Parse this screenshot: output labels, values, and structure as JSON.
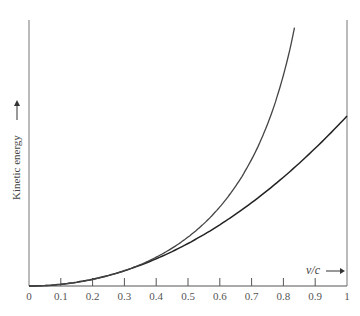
{
  "chart_data": {
    "type": "line",
    "title": "",
    "xlabel": "v/c",
    "ylabel": "Kinetic energy",
    "xlim": [
      0,
      1
    ],
    "x_ticks": [
      "0",
      "0.1",
      "0.2",
      "0.3",
      "0.4",
      "0.5",
      "0.6",
      "0.7",
      "0.8",
      "0.9",
      "1"
    ],
    "grid": false,
    "legend": null,
    "series": [
      {
        "name": "Relativistic (γ − 1)mc²",
        "x": [
          0,
          0.1,
          0.2,
          0.3,
          0.4,
          0.5,
          0.6,
          0.7,
          0.8,
          0.84
        ],
        "values": [
          0,
          0.005,
          0.021,
          0.048,
          0.091,
          0.155,
          0.25,
          0.4,
          0.667,
          0.843
        ]
      },
      {
        "name": "Classical ½mv²",
        "x": [
          0,
          0.1,
          0.2,
          0.3,
          0.4,
          0.5,
          0.6,
          0.7,
          0.8,
          0.9,
          1.0
        ],
        "values": [
          0,
          0.005,
          0.02,
          0.045,
          0.08,
          0.125,
          0.18,
          0.245,
          0.32,
          0.405,
          0.5
        ]
      }
    ]
  },
  "labels": {
    "x_axis": "v/c",
    "y_axis": "Kinetic energy"
  }
}
